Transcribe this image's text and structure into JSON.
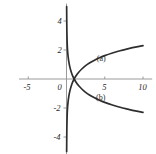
{
  "figure": {
    "width": 156,
    "height": 154,
    "background": "#ffffff",
    "axis_color": "#9a9a9a",
    "curve_color": "#2e2e2e",
    "text_color": "#2b2b2b"
  },
  "chart_data": {
    "type": "line",
    "title": "",
    "xlabel": "",
    "ylabel": "",
    "xlim": [
      -6.2,
      11.2
    ],
    "ylim": [
      -5.2,
      5.2
    ],
    "grid": false,
    "legend": "inline-labels",
    "x_ticks": [
      {
        "value": -5,
        "label": "-5"
      },
      {
        "value": 0,
        "label": "0"
      },
      {
        "value": 5,
        "label": "5"
      },
      {
        "value": 10,
        "label": "10"
      }
    ],
    "y_ticks": [
      {
        "value": 4,
        "label": "4"
      },
      {
        "value": 2,
        "label": "2"
      },
      {
        "value": -2,
        "label": "-2"
      },
      {
        "value": -4,
        "label": "-4"
      }
    ],
    "series": [
      {
        "name": "(a)",
        "label": "(a)",
        "label_x": 5.0,
        "label_y": 1.35,
        "points": [
          [
            0.02,
            -5.0
          ],
          [
            0.03,
            -4.2
          ],
          [
            0.05,
            -3.3
          ],
          [
            0.08,
            -2.6
          ],
          [
            0.12,
            -2.1
          ],
          [
            0.2,
            -1.6
          ],
          [
            0.3,
            -1.2
          ],
          [
            0.45,
            -0.8
          ],
          [
            0.62,
            -0.48
          ],
          [
            0.8,
            -0.22
          ],
          [
            1.0,
            0.0
          ],
          [
            1.25,
            0.22
          ],
          [
            1.6,
            0.47
          ],
          [
            2.0,
            0.69
          ],
          [
            2.5,
            0.92
          ],
          [
            3.0,
            1.1
          ],
          [
            3.6,
            1.28
          ],
          [
            4.3,
            1.46
          ],
          [
            5.0,
            1.61
          ],
          [
            6.0,
            1.79
          ],
          [
            7.0,
            1.95
          ],
          [
            8.0,
            2.08
          ],
          [
            9.0,
            2.2
          ],
          [
            10.0,
            2.3
          ]
        ]
      },
      {
        "name": "(b)",
        "label": "(b)",
        "label_x": 4.9,
        "label_y": -1.35,
        "points": [
          [
            0.02,
            5.0
          ],
          [
            0.03,
            4.2
          ],
          [
            0.05,
            3.3
          ],
          [
            0.08,
            2.6
          ],
          [
            0.12,
            2.1
          ],
          [
            0.2,
            1.6
          ],
          [
            0.3,
            1.2
          ],
          [
            0.45,
            0.8
          ],
          [
            0.62,
            0.48
          ],
          [
            0.8,
            0.22
          ],
          [
            1.0,
            0.0
          ],
          [
            1.25,
            -0.22
          ],
          [
            1.6,
            -0.47
          ],
          [
            2.0,
            -0.69
          ],
          [
            2.5,
            -0.92
          ],
          [
            3.0,
            -1.1
          ],
          [
            3.6,
            -1.28
          ],
          [
            4.3,
            -1.46
          ],
          [
            5.0,
            -1.61
          ],
          [
            6.0,
            -1.79
          ],
          [
            7.0,
            -1.95
          ],
          [
            8.0,
            -2.08
          ],
          [
            9.0,
            -2.2
          ],
          [
            10.0,
            -2.3
          ]
        ]
      }
    ]
  }
}
